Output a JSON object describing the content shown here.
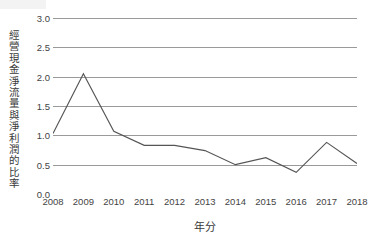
{
  "chart_data": {
    "type": "line",
    "title": "",
    "subtitle": "",
    "xlabel": "年分",
    "ylabel": "經營現金淨流量與淨利潤的比率",
    "categories": [
      "2008",
      "2009",
      "2010",
      "2011",
      "2012",
      "2013",
      "2014",
      "2015",
      "2016",
      "2017",
      "2018"
    ],
    "x": [
      2008,
      2009,
      2010,
      2011,
      2012,
      2013,
      2014,
      2015,
      2016,
      2017,
      2018
    ],
    "series": [
      {
        "name": "經營現金淨流量與淨利潤的比率",
        "values": [
          1.03,
          2.05,
          1.07,
          0.83,
          0.83,
          0.74,
          0.5,
          0.62,
          0.37,
          0.88,
          0.52
        ]
      }
    ],
    "values": [
      1.03,
      2.05,
      1.07,
      0.83,
      0.83,
      0.74,
      0.5,
      0.62,
      0.37,
      0.88,
      0.52
    ],
    "ylim": [
      0.0,
      3.0
    ],
    "ytick_labels": [
      "0.0",
      "0.5",
      "1.0",
      "1.5",
      "2.0",
      "2.5",
      "3.0"
    ],
    "ytick_values": [
      0.0,
      0.5,
      1.0,
      1.5,
      2.0,
      2.5,
      3.0
    ],
    "grid": "horizontal",
    "legend": "none",
    "markers": false,
    "line_color": "#555555",
    "grid_color": "#9a9a9a",
    "background_color": "#ffffff",
    "text_color": "#444444"
  }
}
